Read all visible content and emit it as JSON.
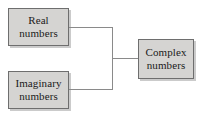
{
  "diagram": {
    "type": "block-flow",
    "background_color": "#ffffff",
    "node_fill_color": "#d5d4d2",
    "node_border_color": "#6e6e6e",
    "edge_color": "#8a8a8a",
    "text_color": "#1a1a1a",
    "nodes": [
      {
        "id": "real",
        "line1": "Real",
        "line2": "numbers",
        "x": 8,
        "y": 8,
        "width": 61,
        "height": 38
      },
      {
        "id": "imaginary",
        "line1": "Imaginary",
        "line2": "numbers",
        "x": 8,
        "y": 71,
        "width": 61,
        "height": 38
      },
      {
        "id": "complex",
        "line1": "Complex",
        "line2": "numbers",
        "x": 138,
        "y": 39,
        "width": 56,
        "height": 40
      }
    ],
    "edges": [
      {
        "id": "real-to-junction",
        "from": "real",
        "to": "junction"
      },
      {
        "id": "imaginary-to-junction",
        "from": "imaginary",
        "to": "junction"
      },
      {
        "id": "junction-to-complex",
        "from": "junction",
        "to": "complex"
      }
    ]
  }
}
